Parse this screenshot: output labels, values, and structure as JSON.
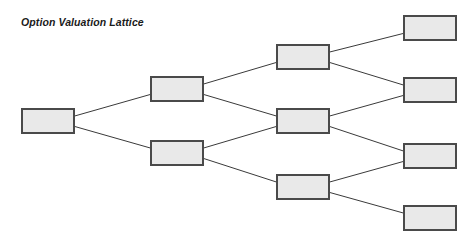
{
  "figure": {
    "title": "Option Valuation Lattice",
    "background_color": "#ffffff",
    "node_fill_color": "#e9e9e9",
    "node_border_color": "#4a4a4a",
    "edge_color": "#3a3a3a"
  },
  "chart_data": {
    "type": "diagram",
    "diagram_kind": "binomial-lattice",
    "title": "Option Valuation Lattice",
    "steps": 4,
    "legend": [],
    "nodes": [
      {
        "id": "n0",
        "column": 0,
        "row": 0,
        "label": "",
        "x": 22,
        "y": 109,
        "w": 52,
        "h": 24
      },
      {
        "id": "n1u",
        "column": 1,
        "row": 0,
        "label": "",
        "x": 151,
        "y": 77,
        "w": 52,
        "h": 24
      },
      {
        "id": "n1d",
        "column": 1,
        "row": 1,
        "label": "",
        "x": 151,
        "y": 141,
        "w": 52,
        "h": 24
      },
      {
        "id": "n2u",
        "column": 2,
        "row": 0,
        "label": "",
        "x": 277,
        "y": 45,
        "w": 52,
        "h": 24
      },
      {
        "id": "n2m",
        "column": 2,
        "row": 1,
        "label": "",
        "x": 277,
        "y": 109,
        "w": 52,
        "h": 24
      },
      {
        "id": "n2d",
        "column": 2,
        "row": 2,
        "label": "",
        "x": 277,
        "y": 175,
        "w": 52,
        "h": 24
      },
      {
        "id": "n3a",
        "column": 3,
        "row": 0,
        "label": "",
        "x": 404,
        "y": 16,
        "w": 52,
        "h": 24
      },
      {
        "id": "n3b",
        "column": 3,
        "row": 1,
        "label": "",
        "x": 404,
        "y": 78,
        "w": 52,
        "h": 24
      },
      {
        "id": "n3c",
        "column": 3,
        "row": 2,
        "label": "",
        "x": 404,
        "y": 144,
        "w": 52,
        "h": 24
      },
      {
        "id": "n3d",
        "column": 3,
        "row": 3,
        "label": "",
        "x": 404,
        "y": 206,
        "w": 52,
        "h": 24
      }
    ],
    "edges": [
      {
        "from": "n0",
        "to": "n1u",
        "direction": "up"
      },
      {
        "from": "n0",
        "to": "n1d",
        "direction": "down"
      },
      {
        "from": "n1u",
        "to": "n2u",
        "direction": "up"
      },
      {
        "from": "n1u",
        "to": "n2m",
        "direction": "down"
      },
      {
        "from": "n1d",
        "to": "n2m",
        "direction": "up"
      },
      {
        "from": "n1d",
        "to": "n2d",
        "direction": "down"
      },
      {
        "from": "n2u",
        "to": "n3a",
        "direction": "up"
      },
      {
        "from": "n2u",
        "to": "n3b",
        "direction": "down"
      },
      {
        "from": "n2m",
        "to": "n3b",
        "direction": "up"
      },
      {
        "from": "n2m",
        "to": "n3c",
        "direction": "down"
      },
      {
        "from": "n2d",
        "to": "n3c",
        "direction": "up"
      },
      {
        "from": "n2d",
        "to": "n3d",
        "direction": "down"
      }
    ]
  }
}
